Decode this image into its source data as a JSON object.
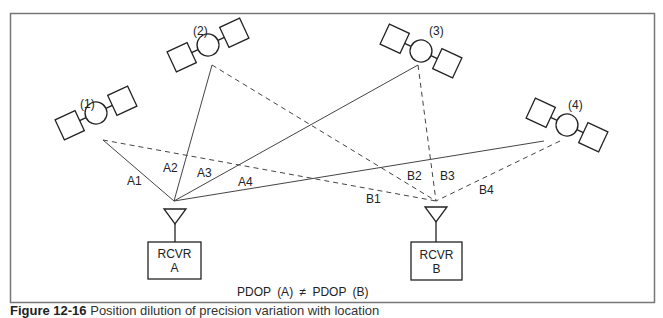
{
  "figure": {
    "satellites": [
      {
        "id": "sat-1",
        "label": "(1)"
      },
      {
        "id": "sat-2",
        "label": "(2)"
      },
      {
        "id": "sat-3",
        "label": "(3)"
      },
      {
        "id": "sat-4",
        "label": "(4)"
      }
    ],
    "receivers": [
      {
        "id": "rcvr-a",
        "line1": "RCVR",
        "line2": "A"
      },
      {
        "id": "rcvr-b",
        "line1": "RCVR",
        "line2": "B"
      }
    ],
    "ranges_a": [
      "A1",
      "A2",
      "A3",
      "A4"
    ],
    "ranges_b": [
      "B1",
      "B2",
      "B3",
      "B4"
    ],
    "equation": "PDOP (A) ≠ PDOP (B)",
    "caption": {
      "number": "Figure 12-16",
      "text": "Position dilution of precision variation with location"
    }
  }
}
